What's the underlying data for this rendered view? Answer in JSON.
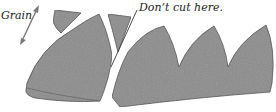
{
  "diagram": {
    "labels": {
      "grain": "Grain",
      "dont_cut": "Don’t cut here."
    },
    "colors": {
      "piece_fill": "#8c8c8c",
      "piece_stroke": "#4a4a4a",
      "arrow": "#7a7a7a",
      "text": "#222222",
      "background": "#ffffff"
    },
    "pieces": [
      {
        "name": "top-left-sliver"
      },
      {
        "name": "left-curved-piece"
      },
      {
        "name": "middle-sliver"
      },
      {
        "name": "scalloped-strip"
      }
    ],
    "annotations": [
      {
        "name": "grain-arrow",
        "direction": "diagonal double-headed"
      },
      {
        "name": "dont-cut-leader-line"
      }
    ]
  }
}
